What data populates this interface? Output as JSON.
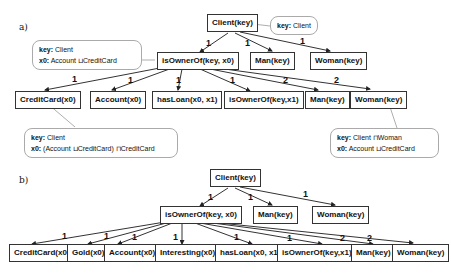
{
  "panel_a": {
    "label": "a)",
    "root": "Client(key)",
    "root_callout": {
      "key_label": "key:",
      "key_value": "Client"
    },
    "level1": [
      "isOwnerOf(key, x0)",
      "Man(key)",
      "Woman(key)"
    ],
    "level1_edge_labels": [
      "1",
      "1",
      "1"
    ],
    "level1_callout": {
      "key_label": "key:",
      "key_value": "Client",
      "x0_label": "x0:",
      "x0_value": "Account ⊔CreditCard"
    },
    "level2": [
      "CreditCard(x0)",
      "Account(x0)",
      "hasLoan(x0, x1)",
      "isOwnerOf(key,x1)",
      "Man(key)",
      "Woman(key)"
    ],
    "level2_edge_labels": [
      "1",
      "1",
      "1",
      "1",
      "2",
      "2"
    ],
    "creditcard_callout": {
      "key_label": "key:",
      "key_value": "Client",
      "x0_label": "x0:",
      "x0_value": "(Account ⊔CreditCard) ⊓CreditCard"
    },
    "woman_callout": {
      "key_label": "key:",
      "key_value": "Client ⊓Woman",
      "x0_label": "x0:",
      "x0_value": "Account ⊔CreditCard"
    }
  },
  "panel_b": {
    "label": "b)",
    "root": "Client(key)",
    "level1": [
      "isOwnerOf(key, x0)",
      "Man(key)",
      "Woman(key)"
    ],
    "level1_edge_labels": [
      "1",
      "1",
      "1"
    ],
    "level2": [
      "CreditCard(x0)",
      "Gold(x0)",
      "Account(x0)",
      "Interesting(x0)",
      "hasLoan(x0, x1)",
      "isOwnerOf(key,x1)",
      "Man(key)",
      "Woman(key)"
    ],
    "level2_edge_labels": [
      "1",
      "1",
      "1",
      "1",
      "1",
      "1",
      "2",
      "2"
    ]
  }
}
